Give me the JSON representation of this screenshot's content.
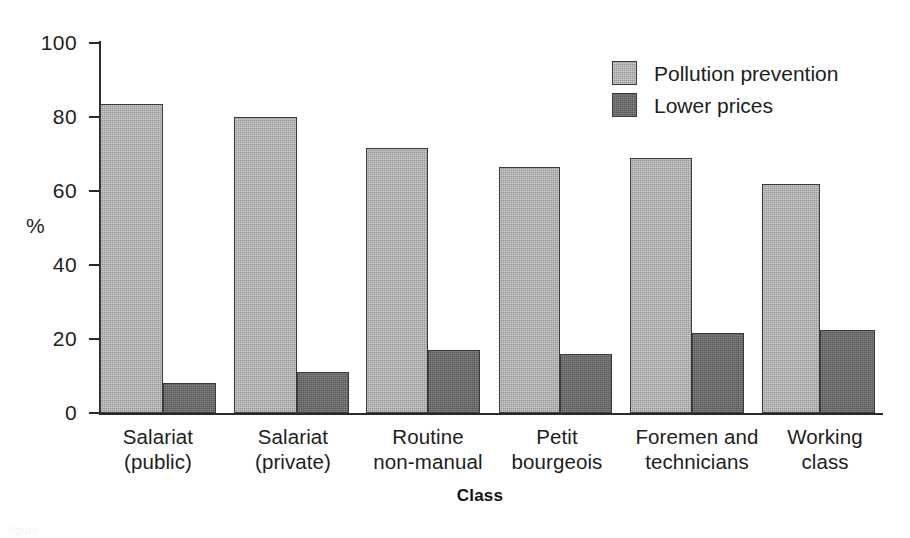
{
  "chart_data": {
    "type": "bar",
    "title": "",
    "xlabel": "Class",
    "ylabel": "%",
    "ylim": [
      0,
      100
    ],
    "ytick_labels": [
      "0",
      "20",
      "40",
      "60",
      "80",
      "100"
    ],
    "ytick_values": [
      0,
      20,
      40,
      60,
      80,
      100
    ],
    "grid": false,
    "legend_position": "top-right",
    "categories": [
      "Salariat\n(public)",
      "Salariat\n(private)",
      "Routine\nnon-manual",
      "Petit\nbourgeois",
      "Foremen and\ntechnicians",
      "Working\nclass"
    ],
    "series": [
      {
        "name": "Pollution prevention",
        "color": "#9a9a9a",
        "values": [
          83.5,
          80,
          71.5,
          66.5,
          69,
          62
        ]
      },
      {
        "name": "Lower prices",
        "color": "#5a5a5a",
        "values": [
          8,
          11,
          17,
          16,
          21.5,
          22.5
        ]
      }
    ]
  },
  "legend": {
    "items": [
      {
        "label": "Pollution prevention",
        "swatch": "light"
      },
      {
        "label": "Lower prices",
        "swatch": "dark"
      }
    ]
  },
  "axes": {
    "y_title": "%",
    "x_title": "Class"
  },
  "scan_footer": "figure"
}
